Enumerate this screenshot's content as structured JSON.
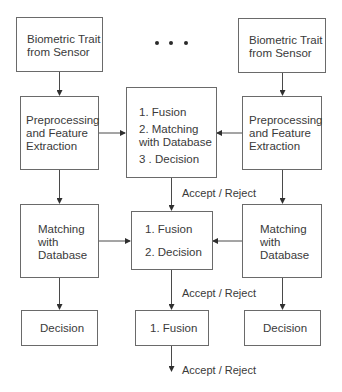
{
  "diagram": {
    "type": "biometric-fusion-levels",
    "ellipsis": "...",
    "left_column": {
      "sensor": "Biometric Trait\nfrom Sensor",
      "preprocessing": "Preprocessing\nand Feature\nExtraction",
      "matching": "Matching\nwith\nDatabase",
      "decision": "Decision"
    },
    "right_column": {
      "sensor": "Biometric Trait\nfrom Sensor",
      "preprocessing": "Preprocessing\nand Feature\nExtraction",
      "matching": "Matching\nwith\nDatabase",
      "decision": "Decision"
    },
    "center": {
      "feature_level": {
        "step1": "1. Fusion",
        "step2": "2. Matching\nwith Database",
        "step3": "3 . Decision"
      },
      "score_level": {
        "step1": "1. Fusion",
        "step2": "2. Decision"
      },
      "decision_level": {
        "step1": "1. Fusion"
      }
    },
    "outputs": {
      "feature_level": "Accept / Reject",
      "score_level": "Accept / Reject",
      "decision_level": "Accept / Reject"
    },
    "colors": {
      "line": "#4a4a4a",
      "text": "#3a3a3a",
      "background": "#ffffff"
    }
  }
}
